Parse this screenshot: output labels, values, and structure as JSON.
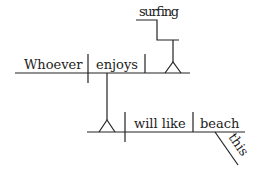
{
  "diagram": {
    "type": "sentence-diagram",
    "words": {
      "subject_clause_subject": "Whoever",
      "subject_clause_verb": "enjoys",
      "gerund_object": "surfing",
      "main_verb": "will like",
      "direct_object": "beach",
      "modifier": "this"
    },
    "colors": {
      "ink": "#222222",
      "background": "#ffffff"
    }
  }
}
